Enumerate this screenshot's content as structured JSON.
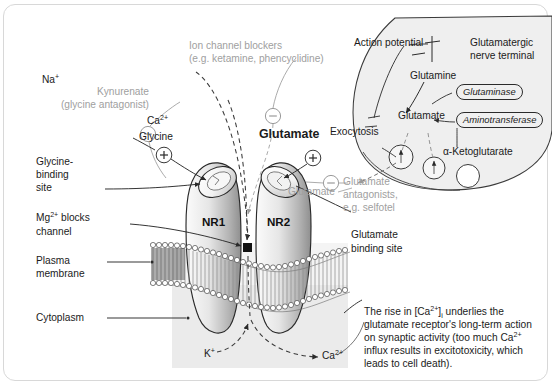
{
  "diagram": {
    "colors": {
      "gray_text": "#a0a0a0",
      "black_text": "#1b1b1b",
      "cytoplasm_fill": "#ebebeb",
      "terminal_fill": "#efefef",
      "subunit_light": "#f4f4f4",
      "subunit_dark": "#9a9a9a",
      "frame_border": "#d8d8d8"
    }
  },
  "labels": {
    "ion_channel_blockers_line1": "Ion channel blockers",
    "ion_channel_blockers_line2": "(e.g. ketamine, phencyclidine)",
    "kynurenate_line1": "Kynurenate",
    "kynurenate_line2": "(glycine antagonist)",
    "glycine": "Glycine",
    "glycine_binding_site_l1": "Glycine-",
    "glycine_binding_site_l2": "binding",
    "glycine_binding_site_l3": "site",
    "mg_blocks_l1": "Mg",
    "mg_blocks_l1_sup": "2+",
    "mg_blocks_l1_tail": " blocks",
    "mg_blocks_l2": "channel",
    "plasma_membrane_l1": "Plasma",
    "plasma_membrane_l2": "membrane",
    "cytoplasm": "Cytoplasm",
    "sodium": "Na",
    "sodium_sup": "+",
    "calcium_top": "Ca",
    "calcium_top_sup": "2+",
    "glutamate_bold": "Glutamate",
    "nr1": "NR1",
    "nr2": "NR2",
    "glutamate_antagonists_l1": "Glutamate",
    "glutamate_antagonists_l2": "antagonists,",
    "glutamate_antagonists_l3": "e.g. selfotel",
    "glutamate_binding_site_l1": "Glutamate",
    "glutamate_binding_site_l2": "binding site",
    "potassium": "K",
    "potassium_sup": "+",
    "calcium_bottom": "Ca",
    "calcium_bottom_sup": "2+",
    "action_potential": "Action potential",
    "nerve_terminal_l1": "Glutamatergic",
    "nerve_terminal_l2": "nerve terminal",
    "glutamine": "Glutamine",
    "glutamate_terminal": "Glutamate",
    "glutaminase": "Glutaminase",
    "aminotransferase": "Aminotransferase",
    "ketoglutarate": "α-Ketoglutarate",
    "exocytosis": "Exocytosis",
    "glutamate_gray": "Glutamate"
  },
  "caption": {
    "line1_a": "The rise in [Ca",
    "line1_sup": "2+",
    "line1_b": "]",
    "line1_sub": "i",
    "line1_c": " underlies the",
    "line2": "glutamate receptor's long-term action",
    "line3_a": "on synaptic activity (too much Ca",
    "line3_sup": "2+",
    "line4": "influx results in excitotoxicity, which",
    "line5": "leads to cell death)."
  },
  "symbols": {
    "plus": "+",
    "minus": "−"
  }
}
